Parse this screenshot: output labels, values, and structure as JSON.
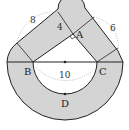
{
  "diagram": {
    "points": {
      "A": {
        "label": "A"
      },
      "B": {
        "label": "B"
      },
      "C": {
        "label": "C"
      },
      "D": {
        "label": "D"
      }
    },
    "lengths": {
      "AB": "8",
      "AC": "6",
      "BC": "10",
      "band_width": "4"
    },
    "colors": {
      "shade": "#d4d4d4",
      "stroke": "#222222",
      "dotted": "#999999"
    }
  }
}
